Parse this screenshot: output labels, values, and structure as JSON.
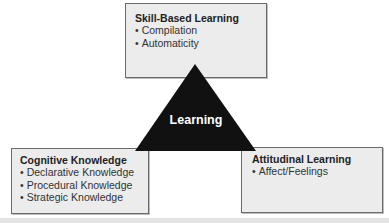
{
  "diagram": {
    "center": {
      "label": "Learning",
      "shape": "triangle",
      "color": "#111111"
    },
    "boxes": {
      "top": {
        "title": "Skill-Based Learning",
        "items": [
          "Compilation",
          "Automaticity"
        ]
      },
      "left": {
        "title": "Cognitive Knowledge",
        "items": [
          "Declarative Knowledge",
          "Procedural Knowledge",
          "Strategic Knowledge"
        ]
      },
      "right": {
        "title": "Attitudinal Learning",
        "items": [
          "Affect/Feelings"
        ]
      }
    },
    "colors": {
      "box_fill": "#ececec",
      "box_border": "#6a6a6a",
      "triangle": "#111111",
      "triangle_text": "#ffffff"
    }
  }
}
